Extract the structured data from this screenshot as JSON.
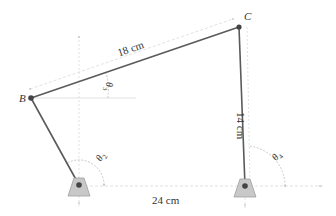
{
  "figure": {
    "type": "four-bar linkage",
    "points": {
      "B": {
        "label": "B",
        "x": 31,
        "y": 98
      },
      "C": {
        "label": "C",
        "x": 239,
        "y": 27
      },
      "A": {
        "x": 79,
        "y": 185
      },
      "D": {
        "x": 245,
        "y": 186
      }
    },
    "links": {
      "crank_AB": {
        "angle_label": "θ",
        "angle_sub": "2"
      },
      "coupler_BC": {
        "length_label": "18 cm",
        "angle_label": "θ",
        "angle_sub": "3"
      },
      "rocker_DC": {
        "length_label": "14 cm",
        "angle_label": "θ",
        "angle_sub": "4"
      },
      "ground_AD": {
        "length_label": "24 cm"
      }
    },
    "colors": {
      "link": "#555555",
      "joint": "#444444",
      "support_fill": "#c8c8c8",
      "support_stroke": "#9a9a9a",
      "construction": "#cfcfcf",
      "text": "#333333"
    }
  }
}
